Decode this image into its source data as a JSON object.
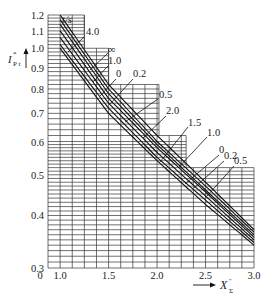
{
  "chart_data": {
    "type": "line",
    "title": "",
    "xlabel": "X''Σ",
    "ylabel": "I*P t",
    "legend_title": "t/s",
    "x_axis_scale": "linear",
    "y_axis_scale": "log",
    "xlim": [
      1.0,
      3.0
    ],
    "ylim": [
      0.3,
      1.2
    ],
    "x_ticks": [
      "0",
      "1.0",
      "1.5",
      "2.0",
      "2.5",
      "3.0"
    ],
    "y_ticks": [
      "1.2",
      "1.1",
      "1.0",
      "0.9",
      "0.8",
      "0.7",
      "0.6",
      "0.5",
      "0.4",
      "0.3"
    ],
    "grid": true,
    "grid_profile_note": "stepped grid: upper bound 1.2 to x≈1.25, 1.0 to x≈1.5, 0.82 to x≈2.0, 0.62 to x≈2.3, 0.52 to x≈3.0",
    "series": [
      {
        "name": "4.0",
        "x": [
          1.0,
          1.5,
          2.0,
          2.5,
          3.0
        ],
        "y": [
          1.2,
          0.82,
          0.62,
          0.48,
          0.37
        ]
      },
      {
        "name": "∞",
        "x": [
          1.0,
          1.5,
          2.0,
          2.5,
          3.0
        ],
        "y": [
          1.17,
          0.8,
          0.6,
          0.47,
          0.365
        ]
      },
      {
        "name": "1.0",
        "x": [
          1.0,
          1.5,
          2.0,
          2.5,
          3.0
        ],
        "y": [
          1.14,
          0.78,
          0.59,
          0.46,
          0.36
        ]
      },
      {
        "name": "0",
        "x": [
          1.0,
          1.5,
          2.0,
          2.5,
          3.0
        ],
        "y": [
          1.1,
          0.76,
          0.58,
          0.455,
          0.355
        ]
      },
      {
        "name": "0.2",
        "x": [
          1.0,
          1.5,
          2.0,
          2.5,
          3.0
        ],
        "y": [
          1.06,
          0.74,
          0.565,
          0.445,
          0.35
        ]
      },
      {
        "name": "0.5",
        "x": [
          1.0,
          1.5,
          2.0,
          2.5,
          3.0
        ],
        "y": [
          1.02,
          0.72,
          0.55,
          0.435,
          0.345
        ]
      },
      {
        "name": "2.0",
        "x": [
          1.0,
          1.5,
          2.0,
          2.5,
          3.0
        ],
        "y": [
          1.0,
          0.7,
          0.54,
          0.425,
          0.34
        ]
      }
    ],
    "annotations_right": [
      "1.5",
      "1.0",
      "0",
      "0.2",
      "0.5"
    ]
  }
}
